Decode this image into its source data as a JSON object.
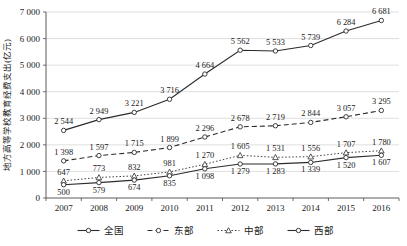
{
  "chart_data": {
    "type": "line",
    "title": "",
    "xlabel": "",
    "ylabel": "地方高等学校教育经费支出(亿元)",
    "categories": [
      "2007",
      "2008",
      "2009",
      "2010",
      "2011",
      "2012",
      "2013",
      "2014",
      "2015",
      "2016"
    ],
    "ylim": [
      0,
      7000
    ],
    "ytick_labels": [
      "0",
      "1 000",
      "2 000",
      "3 000",
      "4 000",
      "5 000",
      "6 000",
      "7 000"
    ],
    "ytick_values": [
      0,
      1000,
      2000,
      3000,
      4000,
      5000,
      6000,
      7000
    ],
    "grid": true,
    "legend_position": "bottom",
    "series": [
      {
        "name": "全国",
        "style": "solid",
        "marker": "circle",
        "values": [
          2544,
          2949,
          3221,
          3716,
          4664,
          5562,
          5533,
          5739,
          6284,
          6681
        ],
        "labels": [
          "2 544",
          "2 949",
          "3 221",
          "3 716",
          "4 664",
          "5 562",
          "5 533",
          "5 739",
          "6 284",
          "6 681"
        ]
      },
      {
        "name": "东部",
        "style": "dashed",
        "marker": "circle",
        "values": [
          1398,
          1597,
          1715,
          1899,
          2296,
          2678,
          2719,
          2844,
          3057,
          3295
        ],
        "labels": [
          "1 398",
          "1 597",
          "1 715",
          "1 899",
          "2 296",
          "2 678",
          "2 719",
          "2 844",
          "3 057",
          "3 295"
        ]
      },
      {
        "name": "中部",
        "style": "dotted",
        "marker": "triangle",
        "values": [
          647,
          773,
          832,
          981,
          1270,
          1605,
          1531,
          1556,
          1707,
          1780
        ],
        "labels": [
          "647",
          "773",
          "832",
          "981",
          "1 270",
          "1 605",
          "1 531",
          "1 556",
          "1 707",
          "1 780"
        ]
      },
      {
        "name": "西部",
        "style": "solid",
        "marker": "circle",
        "values": [
          500,
          579,
          674,
          835,
          1098,
          1279,
          1283,
          1339,
          1520,
          1607
        ],
        "labels": [
          "500",
          "579",
          "674",
          "835",
          "1 098",
          "1 279",
          "1 283",
          "1 339",
          "1 520",
          "1 607"
        ]
      }
    ]
  },
  "legend": {
    "items": [
      {
        "label": "全国"
      },
      {
        "label": "东部"
      },
      {
        "label": "中部"
      },
      {
        "label": "西部"
      }
    ]
  },
  "colors": {
    "line": "#2b2b2b",
    "grid": "#c9c9c9",
    "axis": "#4a4a4a",
    "text": "#1a1a1a",
    "background": "#ffffff"
  }
}
